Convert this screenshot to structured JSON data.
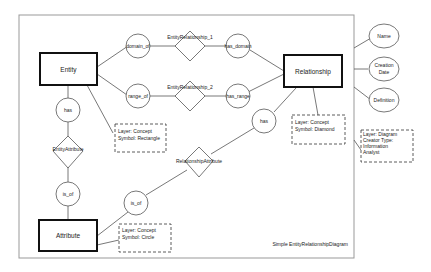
{
  "diagram": {
    "caption": "Simple EntityRelationshipDiagram",
    "entities": {
      "entity": "Entity",
      "relationship": "Relationship",
      "attribute": "Attribute"
    },
    "roles": {
      "domain_of": "domain_of",
      "range_of": "range_of",
      "has_domain": "has_domain",
      "has_range": "has_range",
      "has_left": "has",
      "has_right": "has",
      "is_of_left": "is_of",
      "is_of_right": "is_of"
    },
    "relations": {
      "er1": "EntityRelationship_1",
      "er2": "EntityRelationship_2",
      "entity_attribute": "EntityAttribute",
      "relationship_attribute": "RelationshipAttribute"
    },
    "notes": {
      "rectangle": [
        "Layer: Concept",
        "Symbol: Rectangle"
      ],
      "diamond": [
        "Layer: Concept",
        "Symbol: Diamond"
      ],
      "circle": [
        "Layer: Concept",
        "Symbol: Circle"
      ],
      "diagram": [
        "Layer: Diagram",
        "Creator Type:",
        "Information",
        "Analyst"
      ]
    },
    "properties": {
      "name": "Name",
      "creation_date": [
        "Creation",
        "Date"
      ],
      "definition": "Definition"
    }
  }
}
